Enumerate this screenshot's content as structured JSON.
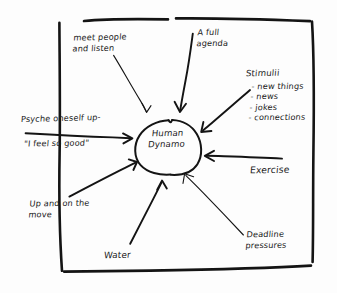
{
  "diagram": {
    "style": "hand-drawn sketch, black ink on white paper",
    "background_color": "#fdfdfd",
    "ink_color": "#141414",
    "center": {
      "label_line1": "Human",
      "label_line2": "Dynamo",
      "shape": "circle"
    },
    "nodes": [
      {
        "id": "meet-people",
        "text": "meet people\nand listen",
        "position": "top-left",
        "arrow": "points down-right into circle"
      },
      {
        "id": "full-agenda",
        "text": "A full\nagenda",
        "position": "top-right",
        "arrow": "points down-left into circle"
      },
      {
        "id": "stimulii",
        "title": "Stimulii",
        "items": [
          "- new things",
          "- news",
          "- jokes",
          "- connections"
        ],
        "position": "right-upper",
        "arrow": "points down-left into circle"
      },
      {
        "id": "psyche-oneself-up",
        "text": "Psyche oneself up-",
        "quote": "\"I feel so good\"",
        "position": "left",
        "arrow": "points right into circle"
      },
      {
        "id": "exercise",
        "text": "Exercise",
        "position": "right-lower",
        "arrow": "points left into circle"
      },
      {
        "id": "up-and-on-the-move",
        "text": "Up and on the\nmove",
        "position": "bottom-left",
        "arrow": "points up-right into circle"
      },
      {
        "id": "water",
        "text": "Water",
        "position": "bottom-center",
        "arrow": "points up into circle"
      },
      {
        "id": "deadline-pressures",
        "text": "Deadline\npressures",
        "position": "bottom-right",
        "arrow": "points up-left into circle"
      }
    ]
  }
}
